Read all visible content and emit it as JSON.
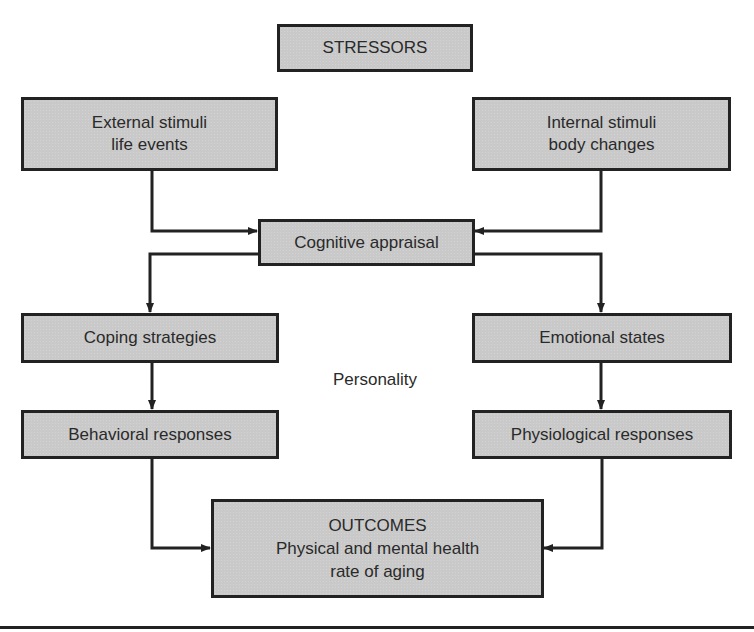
{
  "diagram": {
    "nodes": {
      "stressors": {
        "lines": [
          "STRESSORS"
        ]
      },
      "external": {
        "lines": [
          "External stimuli",
          "life events"
        ]
      },
      "internal": {
        "lines": [
          "Internal stimuli",
          "body changes"
        ]
      },
      "appraisal": {
        "lines": [
          "Cognitive appraisal"
        ]
      },
      "coping": {
        "lines": [
          "Coping strategies"
        ]
      },
      "emotional": {
        "lines": [
          "Emotional states"
        ]
      },
      "behavioral": {
        "lines": [
          "Behavioral responses"
        ]
      },
      "physiological": {
        "lines": [
          "Physiological responses"
        ]
      },
      "outcomes": {
        "lines": [
          "OUTCOMES",
          "Physical and mental health",
          "rate of aging"
        ]
      }
    },
    "center_label": "Personality",
    "edges": [
      {
        "from": "External stimuli life events",
        "to": "Cognitive appraisal"
      },
      {
        "from": "Internal stimuli body changes",
        "to": "Cognitive appraisal"
      },
      {
        "from": "Cognitive appraisal",
        "to": "Coping strategies"
      },
      {
        "from": "Cognitive appraisal",
        "to": "Emotional states"
      },
      {
        "from": "Coping strategies",
        "to": "Behavioral responses"
      },
      {
        "from": "Emotional states",
        "to": "Physiological responses"
      },
      {
        "from": "Behavioral responses",
        "to": "OUTCOMES"
      },
      {
        "from": "Physiological responses",
        "to": "OUTCOMES"
      }
    ],
    "colors": {
      "box_fill": "#c9c9c9",
      "stroke": "#222222",
      "text": "#2a2a2a",
      "background": "#ffffff"
    }
  }
}
